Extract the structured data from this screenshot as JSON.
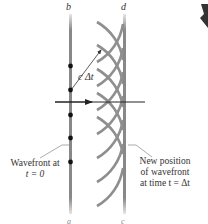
{
  "labels": {
    "top_left": "b",
    "top_right": "d",
    "c_delta_t": "c Δt",
    "bottom_left": "a",
    "bottom_right": "c"
  },
  "captions": {
    "left_line1": "Wavefront at",
    "left_line2": "t = 0",
    "right_line1": "New position",
    "right_line2": "of wavefront",
    "right_line3": "at time t = Δt"
  },
  "colors": {
    "wavefront": "#8a8a8a",
    "arc": "#8f8f8f",
    "arrow": "#222222",
    "dot": "#111111",
    "text": "#333333"
  }
}
